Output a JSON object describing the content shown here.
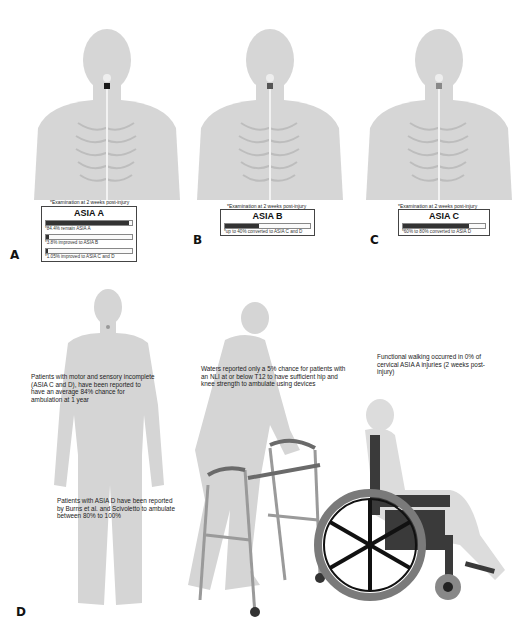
{
  "panels": {
    "A": {
      "label": "A",
      "caption": "*Examination at 2 weeks post-injury",
      "title": "ASIA A",
      "rows": [
        {
          "text": "*84.4% remain ASIA A",
          "pct": 97
        },
        {
          "text": "*3.8% improved to ASIA B",
          "pct": 4
        },
        {
          "text": "*1.05% improved to ASIA C and D",
          "pct": 2
        }
      ]
    },
    "B": {
      "label": "B",
      "caption": "*Examination at 2 weeks post-injury",
      "title": "ASIA B",
      "rows": [
        {
          "text": "*up to 40% converted to ASIA C and D",
          "pct": 40
        }
      ]
    },
    "C": {
      "label": "C",
      "caption": "*Examination at 2 weeks post-injury",
      "title": "ASIA C",
      "rows": [
        {
          "text": "*60% to 80% converted to ASIA D",
          "pct": 80
        }
      ]
    },
    "D": {
      "label": "D",
      "notes": {
        "incomplete": "Patients with motor and sensory incomplete (ASIA C and D), have been reported to have an average 84% chance for ambulation at 1 year",
        "asia_d": "Patients with ASIA D have been reported by Burns et al. and Scivoletto to ambulate between 80% to 100%",
        "waters": "Waters reported only a 5% chance for patients with an NLI at or below T12 to have sufficient hip and knee strength to ambulate using devices",
        "functional": "Functional walking occurred in 0% of cervical ASIA A injuries (2 weeks post-injury)"
      }
    }
  },
  "colors": {
    "body_gray": "#d4d4d4",
    "lesion": "#1a1a1a",
    "bar_fill": "#333333",
    "wheel": "#7a7a7a",
    "frame": "#3a3a3a"
  }
}
